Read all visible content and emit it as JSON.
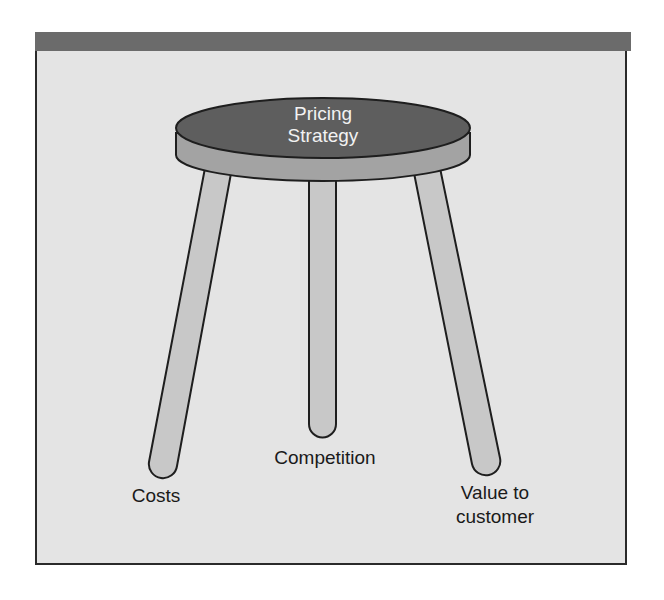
{
  "diagram": {
    "seat": {
      "label_line1": "Pricing",
      "label_line2": "Strategy"
    },
    "legs": [
      {
        "id": "costs",
        "label": "Costs"
      },
      {
        "id": "competition",
        "label": "Competition"
      },
      {
        "id": "value",
        "label_line1": "Value to",
        "label_line2": "customer"
      }
    ],
    "colors": {
      "header_bar": "#6b6b6b",
      "background": "#e4e4e4",
      "seat_top": "#5e5e5e",
      "seat_rim": "#a3a3a3",
      "legs": "#c8c8c8",
      "outline": "#1e1e1e"
    }
  }
}
